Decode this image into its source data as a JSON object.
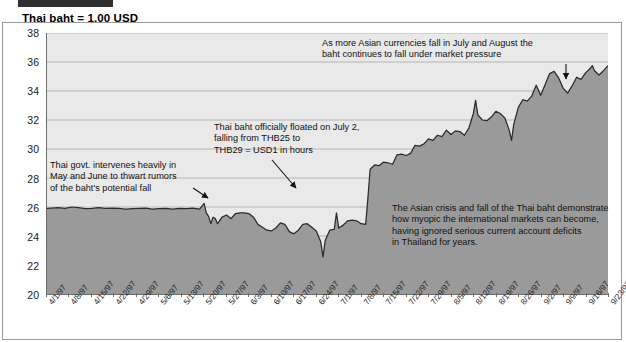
{
  "chart_title": "Thai baht = 1.00 USD",
  "chart_data": {
    "type": "area",
    "title": "Thai baht = 1.00 USD",
    "xlabel": "",
    "ylabel": "",
    "ylim": [
      20,
      38
    ],
    "yticks": [
      20,
      22,
      24,
      26,
      28,
      30,
      32,
      34,
      36,
      38
    ],
    "grid": true,
    "legend": "none",
    "fill_color": "#9a9a9a",
    "line_color": "#2b2b2b",
    "plot_bg": "#e9e9e9",
    "categories": [
      "4/1/97",
      "4/8/97",
      "4/15/97",
      "4/22/97",
      "4/29/97",
      "5/6/97",
      "5/13/97",
      "5/20/97",
      "5/27/97",
      "6/3/97",
      "6/10/97",
      "6/17/97",
      "6/24/97",
      "7/1/97",
      "7/8/97",
      "7/15/97",
      "7/22/97",
      "7/29/97",
      "8/5/97",
      "8/12/97",
      "8/19/97",
      "8/26/97",
      "9/2/97",
      "9/9/97",
      "9/16/97",
      "9/23/97"
    ],
    "series": [
      {
        "name": "Thai baht per USD",
        "values": [
          25.9,
          25.95,
          26.0,
          25.9,
          25.85,
          25.9,
          25.95,
          24.8,
          25.5,
          25.3,
          24.5,
          24.6,
          24.4,
          28.9,
          29.6,
          30.2,
          30.7,
          31.8,
          32.0,
          32.9,
          33.1,
          34.4,
          34.3,
          35.5,
          35.0,
          35.7
        ]
      }
    ],
    "detailed_points": [
      [
        0,
        25.9
      ],
      [
        2,
        25.92
      ],
      [
        5,
        25.95
      ],
      [
        8,
        25.9
      ],
      [
        11,
        26.0
      ],
      [
        14,
        25.95
      ],
      [
        17,
        25.88
      ],
      [
        20,
        25.9
      ],
      [
        23,
        25.95
      ],
      [
        26,
        25.9
      ],
      [
        29,
        25.92
      ],
      [
        32,
        25.9
      ],
      [
        35,
        25.85
      ],
      [
        38,
        25.88
      ],
      [
        41,
        25.9
      ],
      [
        44,
        25.92
      ],
      [
        47,
        25.85
      ],
      [
        50,
        25.88
      ],
      [
        53,
        25.9
      ],
      [
        56,
        25.86
      ],
      [
        59,
        25.9
      ],
      [
        62,
        25.88
      ],
      [
        65,
        25.92
      ],
      [
        68,
        25.85
      ],
      [
        70,
        26.25
      ],
      [
        71,
        25.6
      ],
      [
        72,
        25.35
      ],
      [
        73,
        24.85
      ],
      [
        74,
        25.3
      ],
      [
        75,
        25.2
      ],
      [
        76,
        24.85
      ],
      [
        78,
        25.3
      ],
      [
        80,
        25.45
      ],
      [
        82,
        25.2
      ],
      [
        84,
        25.55
      ],
      [
        86,
        25.6
      ],
      [
        88,
        25.6
      ],
      [
        90,
        25.55
      ],
      [
        92,
        25.3
      ],
      [
        94,
        24.8
      ],
      [
        96,
        24.6
      ],
      [
        98,
        24.4
      ],
      [
        100,
        24.35
      ],
      [
        102,
        24.55
      ],
      [
        104,
        24.9
      ],
      [
        106,
        24.8
      ],
      [
        108,
        24.3
      ],
      [
        110,
        24.15
      ],
      [
        112,
        24.4
      ],
      [
        114,
        24.8
      ],
      [
        116,
        24.85
      ],
      [
        118,
        24.6
      ],
      [
        120,
        24.35
      ],
      [
        122,
        23.6
      ],
      [
        123,
        22.55
      ],
      [
        124,
        23.7
      ],
      [
        126,
        24.4
      ],
      [
        128,
        24.45
      ],
      [
        129,
        25.6
      ],
      [
        130,
        24.55
      ],
      [
        132,
        24.75
      ],
      [
        134,
        25.05
      ],
      [
        136,
        25.1
      ],
      [
        138,
        25.05
      ],
      [
        140,
        24.85
      ],
      [
        142,
        24.8
      ],
      [
        143,
        26.6
      ],
      [
        144,
        28.6
      ],
      [
        146,
        28.9
      ],
      [
        148,
        28.85
      ],
      [
        150,
        29.1
      ],
      [
        152,
        29.05
      ],
      [
        154,
        28.95
      ],
      [
        156,
        29.6
      ],
      [
        158,
        29.65
      ],
      [
        160,
        29.55
      ],
      [
        162,
        29.7
      ],
      [
        164,
        30.25
      ],
      [
        166,
        30.2
      ],
      [
        168,
        30.35
      ],
      [
        170,
        30.7
      ],
      [
        172,
        30.6
      ],
      [
        174,
        30.95
      ],
      [
        176,
        30.85
      ],
      [
        178,
        31.3
      ],
      [
        180,
        31.0
      ],
      [
        182,
        31.25
      ],
      [
        184,
        31.2
      ],
      [
        186,
        30.95
      ],
      [
        188,
        31.45
      ],
      [
        190,
        32.45
      ],
      [
        191,
        33.35
      ],
      [
        192,
        32.35
      ],
      [
        194,
        32.0
      ],
      [
        196,
        31.95
      ],
      [
        198,
        32.2
      ],
      [
        200,
        32.6
      ],
      [
        202,
        32.45
      ],
      [
        204,
        32.15
      ],
      [
        206,
        31.3
      ],
      [
        207,
        30.6
      ],
      [
        208,
        31.7
      ],
      [
        210,
        32.85
      ],
      [
        212,
        33.4
      ],
      [
        214,
        33.3
      ],
      [
        216,
        33.65
      ],
      [
        218,
        34.4
      ],
      [
        220,
        33.7
      ],
      [
        222,
        34.45
      ],
      [
        224,
        35.2
      ],
      [
        226,
        35.35
      ],
      [
        228,
        34.9
      ],
      [
        230,
        34.2
      ],
      [
        232,
        33.85
      ],
      [
        234,
        34.35
      ],
      [
        236,
        34.95
      ],
      [
        238,
        34.8
      ],
      [
        240,
        35.25
      ],
      [
        242,
        35.55
      ],
      [
        243,
        35.75
      ],
      [
        244,
        35.4
      ],
      [
        246,
        35.1
      ],
      [
        248,
        35.4
      ],
      [
        250,
        35.75
      ]
    ]
  },
  "annotations": {
    "a1": "As more Asian currencies fall in July and August the\nbaht continues to fall under market pressure",
    "a2": "Thai baht officially floated on July 2,\nfalling from THB25 to\nTHB29 = USD1 in hours",
    "a3": "Thai govt. intervenes heavily in\nMay and June to thwart rumors\nof the baht's potential fall",
    "a4": "The Asian crisis and fall of the Thai baht demonstrate\nhow myopic the international markets can become,\nhaving ignored serious current account deficits\nin Thailand for years."
  }
}
